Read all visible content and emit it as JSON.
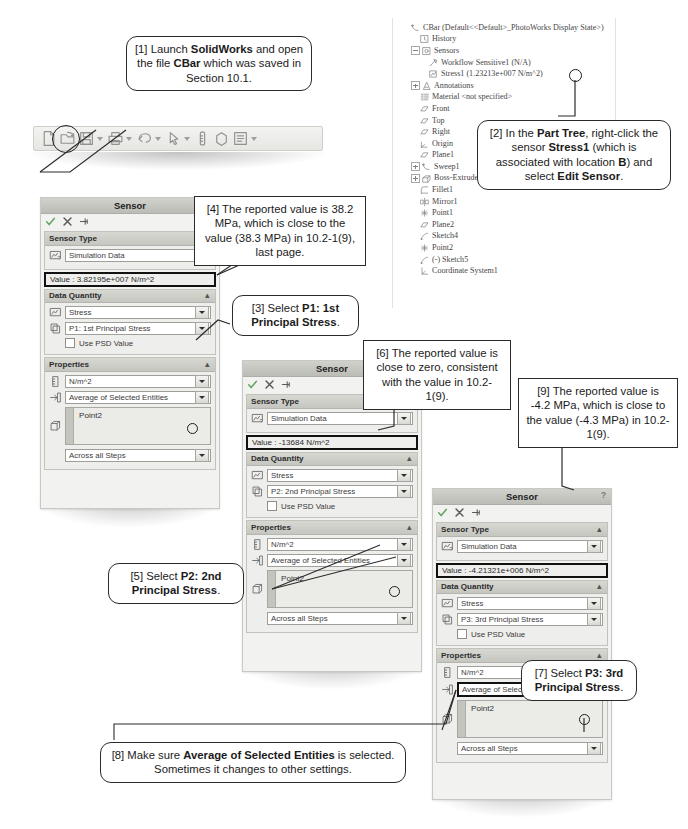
{
  "toolbar": {
    "name": "solidworks-toolbar",
    "icons": [
      "new-document-icon",
      "open-folder-icon",
      "save-icon",
      "print-icon",
      "undo-icon",
      "select-icon",
      "measure-icon",
      "appearance-icon",
      "options-icon"
    ],
    "highlighted_icon": "open-folder-icon"
  },
  "tree": {
    "title": "CBar  (Default<<Default>_PhotoWorks Display State>)",
    "items": [
      {
        "label": "History",
        "icon": "history-icon",
        "indent": 1,
        "expand": "none"
      },
      {
        "label": "Sensors",
        "icon": "sensors-icon",
        "indent": 1,
        "expand": "minus"
      },
      {
        "label": "Workflow Sensitive1 (N/A)",
        "icon": "workflow-sensor-icon",
        "indent": 2,
        "expand": "none"
      },
      {
        "label": "Stress1 (1.23213e+007 N/m^2)",
        "icon": "stress-sensor-icon",
        "indent": 2,
        "expand": "none"
      },
      {
        "label": "Annotations",
        "icon": "annotations-icon",
        "indent": 1,
        "expand": "plus"
      },
      {
        "label": "Material <not specified>",
        "icon": "material-icon",
        "indent": 1,
        "expand": "none"
      },
      {
        "label": "Front",
        "icon": "plane-icon",
        "indent": 1,
        "expand": "none"
      },
      {
        "label": "Top",
        "icon": "plane-icon",
        "indent": 1,
        "expand": "none"
      },
      {
        "label": "Right",
        "icon": "plane-icon",
        "indent": 1,
        "expand": "none"
      },
      {
        "label": "Origin",
        "icon": "origin-icon",
        "indent": 1,
        "expand": "none"
      },
      {
        "label": "Plane1",
        "icon": "plane-icon",
        "indent": 1,
        "expand": "none"
      },
      {
        "label": "Sweep1",
        "icon": "sweep-icon",
        "indent": 1,
        "expand": "plus"
      },
      {
        "label": "Boss-Extrude1",
        "icon": "boss-extrude-icon",
        "indent": 1,
        "expand": "plus"
      },
      {
        "label": "Fillet1",
        "icon": "fillet-icon",
        "indent": 1,
        "expand": "none"
      },
      {
        "label": "Mirror1",
        "icon": "mirror-icon",
        "indent": 1,
        "expand": "none"
      },
      {
        "label": "Point1",
        "icon": "point-icon",
        "indent": 1,
        "expand": "none"
      },
      {
        "label": "Plane2",
        "icon": "plane-icon",
        "indent": 1,
        "expand": "none"
      },
      {
        "label": "Sketch4",
        "icon": "sketch-icon",
        "indent": 1,
        "expand": "none"
      },
      {
        "label": "Point2",
        "icon": "point-icon",
        "indent": 1,
        "expand": "none"
      },
      {
        "label": "(-) Sketch5",
        "icon": "sketch-icon",
        "indent": 1,
        "expand": "none"
      },
      {
        "label": "Coordinate System1",
        "icon": "coordinate-system-icon",
        "indent": 1,
        "expand": "none"
      }
    ]
  },
  "panels": [
    {
      "id": "sensor-panel-1",
      "title": "Sensor",
      "help": "?",
      "sensor_type_header": "Sensor Type",
      "sensor_type_value": "Simulation Data",
      "value_text": "Value : 3.82195e+007 N/m^2",
      "data_quantity_header": "Data Quantity",
      "quantity_value": "Stress",
      "component_value": "P1: 1st Principal Stress",
      "psd_label": "Use PSD Value",
      "properties_header": "Properties",
      "units_value": "N/m^2",
      "criterion_value": "Average of Selected Entities",
      "entity_value": "Point2",
      "steps_value": "Across all Steps",
      "component_highlighted": false,
      "criterion_highlighted": false
    },
    {
      "id": "sensor-panel-2",
      "title": "Sensor",
      "help": "?",
      "sensor_type_header": "Sensor Type",
      "sensor_type_value": "Simulation Data",
      "value_text": "Value : -13684 N/m^2",
      "data_quantity_header": "Data Quantity",
      "quantity_value": "Stress",
      "component_value": "P2: 2nd Principal Stress",
      "psd_label": "Use PSD Value",
      "properties_header": "Properties",
      "units_value": "N/m^2",
      "criterion_value": "Average of Selected Entities",
      "entity_value": "Point2",
      "steps_value": "Across all Steps",
      "component_highlighted": false,
      "criterion_highlighted": false
    },
    {
      "id": "sensor-panel-3",
      "title": "Sensor",
      "help": "?",
      "sensor_type_header": "Sensor Type",
      "sensor_type_value": "Simulation Data",
      "value_text": "Value : -4.21321e+006 N/m^2",
      "data_quantity_header": "Data Quantity",
      "quantity_value": "Stress",
      "component_value": "P3: 3rd Principal Stress",
      "psd_label": "Use PSD Value",
      "properties_header": "Properties",
      "units_value": "N/m^2",
      "criterion_value": "Average of Selected Entities",
      "entity_value": "Point2",
      "steps_value": "Across all Steps",
      "component_highlighted": false,
      "criterion_highlighted": true
    }
  ],
  "callouts": {
    "c1": "[1] Launch <b>SolidWorks</b> and open the file <b>CBar</b> which was saved in Section 10.1.",
    "c2": "[2] In the <b>Part Tree</b>, right-click the sensor <b>Stress1</b> (which is associated with location <b>B</b>) and select <b>Edit Sensor</b>.",
    "c3": "[3] Select <b>P1: 1st Principal Stress</b>.",
    "c4": "[4] The reported value is 38.2 MPa, which is close to the value (38.3 MPa) in 10.2-1(9), last page.",
    "c5": "[5] Select <b>P2: 2nd Principal Stress</b>.",
    "c6": "[6] The reported value is close to zero, consistent with the value in 10.2-1(9).",
    "c7": "[7] Select <b>P3: 3rd Principal Stress</b>.",
    "c8": "[8]  Make sure <b>Average of Selected Entities</b> is selected.  Sometimes it changes to other settings.",
    "c9": "[9] The reported value is -4.2 MPa, which is close to the value (-4.3 MPa) in 10.2-1(9)."
  },
  "colors": {
    "panel_bg": "#f2f2f0",
    "header_grad_top": "#d8d8d3",
    "callout_border": "#2b2b2b",
    "text": "#231f20"
  }
}
